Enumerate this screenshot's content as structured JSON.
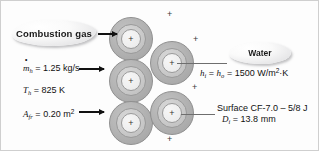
{
  "figure": {
    "background": "#fdfdfd",
    "border_color": "#cfcfcf"
  },
  "callouts": {
    "combustion_gas": "Combustion gas",
    "water": "Water"
  },
  "left_parameters": [
    {
      "name": "mass-flow-rate",
      "symbol": "m",
      "symbol_dot": true,
      "subscript": "h",
      "equals": "=",
      "value": "1.25",
      "unit": "kg/s",
      "full_text": "mh = 1.25 kg/s"
    },
    {
      "name": "hot-inlet-temperature",
      "symbol": "T",
      "subscript": "h",
      "equals": "=",
      "value": "825",
      "unit": "K",
      "full_text": "Th = 825 K"
    },
    {
      "name": "frontal-area",
      "symbol": "A",
      "subscript": "fr",
      "equals": "=",
      "value": "0.20",
      "unit": "m",
      "unit_exponent": "2",
      "full_text": "Afr = 0.20 m2"
    }
  ],
  "right_parameters": [
    {
      "name": "convection-coefficients",
      "symbol_1": "h",
      "subscript_1": "i",
      "symbol_2": "h",
      "subscript_2": "o",
      "equals": "=",
      "value": "1500",
      "unit": "W/m",
      "unit_exponent": "2",
      "unit_tail": "·K",
      "full_text": "hi = ho = 1500 W/m2·K"
    }
  ],
  "surface_note": {
    "name": "surface-designation",
    "line1": "Surface CF-7.0 – 5/8 J",
    "symbol": "D",
    "subscript": "i",
    "equals": "=",
    "value": "13.8",
    "unit": "mm",
    "line2": "Di = 13.8 mm"
  },
  "tubes": [
    {
      "id": "tube-1",
      "x": 108,
      "y": 16,
      "size": 44,
      "column": 1,
      "row": 1
    },
    {
      "id": "tube-2",
      "x": 108,
      "y": 58,
      "size": 44,
      "column": 1,
      "row": 2
    },
    {
      "id": "tube-3",
      "x": 108,
      "y": 100,
      "size": 44,
      "column": 1,
      "row": 3
    },
    {
      "id": "tube-4",
      "x": 149,
      "y": 40,
      "size": 44,
      "column": 2,
      "row": 1
    },
    {
      "id": "tube-5",
      "x": 149,
      "y": 90,
      "size": 44,
      "column": 2,
      "row": 2
    }
  ],
  "tube_marks": {
    "center_symbol": "+"
  },
  "flow_marks": [
    {
      "id": "plus-mark-1",
      "x": 166,
      "y": 9,
      "symbol": "+"
    },
    {
      "id": "plus-mark-2",
      "x": 192,
      "y": 34,
      "symbol": "+"
    },
    {
      "id": "plus-mark-3",
      "x": 191,
      "y": 82,
      "symbol": "+"
    },
    {
      "id": "plus-mark-4",
      "x": 166,
      "y": 134,
      "symbol": "+"
    }
  ],
  "arrows": [
    {
      "id": "arrow-inlet-top",
      "x": 97,
      "y": 32,
      "length": 19
    },
    {
      "id": "arrow-inlet-middle",
      "x": 78,
      "y": 67,
      "length": 25
    },
    {
      "id": "arrow-inlet-bottom",
      "x": 78,
      "y": 110,
      "length": 25
    }
  ],
  "leaders": [
    {
      "id": "leader-to-water-label",
      "x": 176,
      "y": 62,
      "length": 50
    },
    {
      "id": "leader-to-surface-label",
      "x": 180,
      "y": 113,
      "length": 34
    }
  ],
  "colors": {
    "fin_outer": "#b4b4b4",
    "tube_wall": "#cacaca",
    "tube_bore": "#efefef",
    "outline": "#8f8f8f",
    "text": "#111111",
    "leader": "#6e6e6e",
    "arrow": "#111111"
  }
}
